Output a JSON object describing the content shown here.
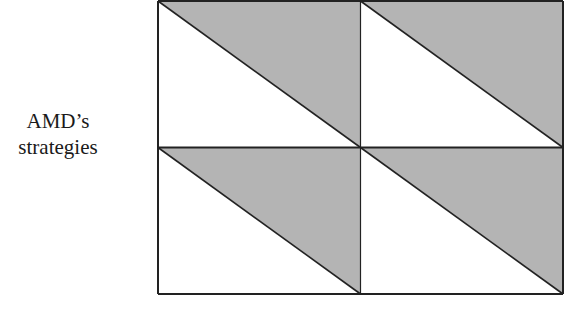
{
  "row_player_label": {
    "line1": "AMD’s",
    "line2": "strategies"
  },
  "matrix": {
    "rows": 2,
    "columns": 2,
    "cells": [
      {
        "row": 0,
        "col": 0,
        "upper_payoff": "",
        "lower_payoff": ""
      },
      {
        "row": 0,
        "col": 1,
        "upper_payoff": "",
        "lower_payoff": ""
      },
      {
        "row": 1,
        "col": 0,
        "upper_payoff": "",
        "lower_payoff": ""
      },
      {
        "row": 1,
        "col": 1,
        "upper_payoff": "",
        "lower_payoff": ""
      }
    ],
    "colors": {
      "shade": "#b4b4b4",
      "blank": "#ffffff",
      "line": "#222222"
    }
  }
}
